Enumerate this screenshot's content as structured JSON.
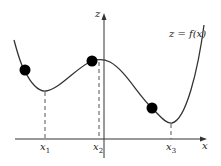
{
  "diagram": {
    "title": "z = f(x)",
    "axes": {
      "x_label": "x",
      "z_label": "z"
    },
    "curve_label": "z = f(x)",
    "tick_labels": [
      {
        "name": "x",
        "sub": "1"
      },
      {
        "name": "x",
        "sub": "2"
      },
      {
        "name": "x",
        "sub": "3"
      }
    ],
    "points": [
      {
        "description": "point on descending slope left of x1"
      },
      {
        "description": "local maximum near x2"
      },
      {
        "description": "point on descending slope left of x3"
      }
    ],
    "colors": {
      "curve": "#333333",
      "axis": "#333333",
      "dots": "#000000",
      "dashes": "#555555"
    }
  }
}
